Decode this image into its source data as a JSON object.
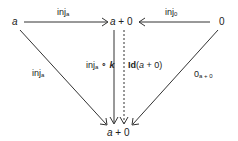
{
  "diagram": {
    "type": "commutative-diagram",
    "nodes": {
      "left": {
        "var": "a"
      },
      "top": {
        "var": "a",
        "rest": " + 0"
      },
      "right": {
        "text": "0"
      },
      "bottom": {
        "var": "a",
        "rest": " + 0"
      }
    },
    "edges": {
      "top_left_arrow": {
        "base": "inj",
        "sub": "a"
      },
      "top_right_arrow": {
        "base": "inj",
        "sub": "0"
      },
      "diag_left": {
        "base": "inj",
        "sub": "a"
      },
      "vertical_solid": {
        "base": "inj",
        "sub": "a",
        "op": " ∘ ",
        "var": "k"
      },
      "vertical_dotted": {
        "bold": "Id",
        "open": "(",
        "var": "a",
        "close": " + 0)"
      },
      "diag_right": {
        "base": "0",
        "sub": "a + 0"
      }
    },
    "colors": {
      "stroke": "#333333",
      "text": "#222222"
    }
  }
}
